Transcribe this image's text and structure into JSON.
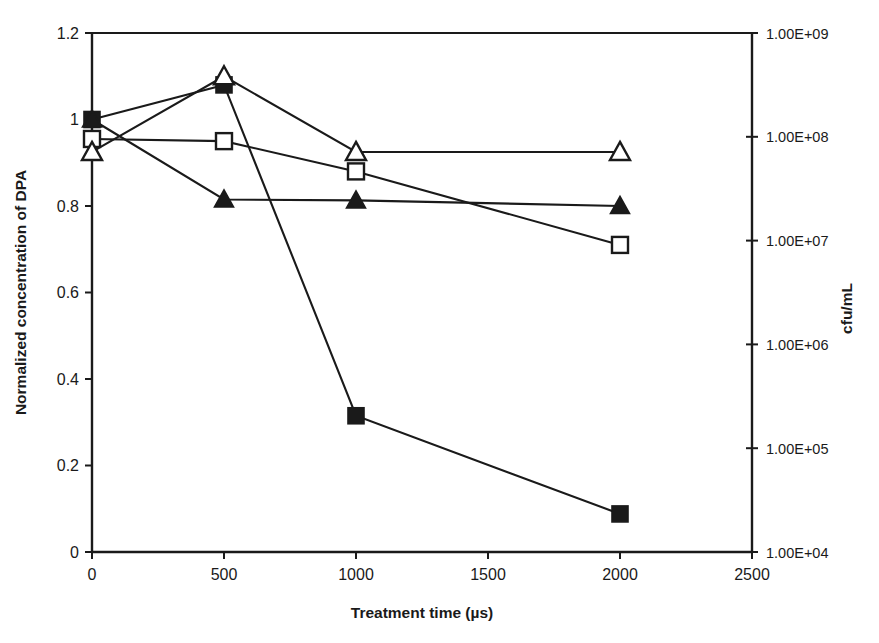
{
  "chart_data": {
    "type": "line",
    "title": "",
    "xlabel": "Treatment time (µs)",
    "ylabel": "Normalized concentration of DPA",
    "y2label": "cfu/mL",
    "x": [
      0,
      500,
      1000,
      2000
    ],
    "xlim": [
      0,
      2500
    ],
    "ylim": [
      0,
      1.2
    ],
    "y2lim": [
      10000,
      1000000000
    ],
    "y2scale": "log",
    "grid": false,
    "legend": "none",
    "xticks": [
      "0",
      "500",
      "1000",
      "1500",
      "2000",
      "2500"
    ],
    "xtick_values": [
      0,
      500,
      1000,
      1500,
      2000,
      2500
    ],
    "yticks": [
      "0",
      "0.2",
      "0.4",
      "0.6",
      "0.8",
      "1",
      "1.2"
    ],
    "ytick_values": [
      0,
      0.2,
      0.4,
      0.6,
      0.8,
      1,
      1.2
    ],
    "y2ticks": [
      "1.00E+04",
      "1.00E+05",
      "1.00E+06",
      "1.00E+07",
      "1.00E+08",
      "1.00E+09"
    ],
    "y2tick_values": [
      10000,
      100000,
      1000000,
      10000000,
      100000000,
      1000000000
    ],
    "series": [
      {
        "name": "filled-square",
        "marker": "filled-square",
        "axis": "right",
        "values_axis_units": [
          200000000.0,
          320000000.0,
          2000000.0,
          30000.0
        ],
        "values_normalized": [
          1.0,
          1.08,
          0.315,
          0.088
        ]
      },
      {
        "name": "open-square",
        "marker": "open-square",
        "axis": "left",
        "values_normalized": [
          0.955,
          0.95,
          0.88,
          0.71
        ]
      },
      {
        "name": "open-triangle",
        "marker": "open-triangle",
        "axis": "left",
        "values_normalized": [
          0.925,
          1.1,
          0.925,
          0.925
        ]
      },
      {
        "name": "filled-triangle",
        "marker": "filled-triangle",
        "axis": "left",
        "values_normalized": [
          1.0,
          0.815,
          0.813,
          0.8
        ]
      }
    ]
  }
}
